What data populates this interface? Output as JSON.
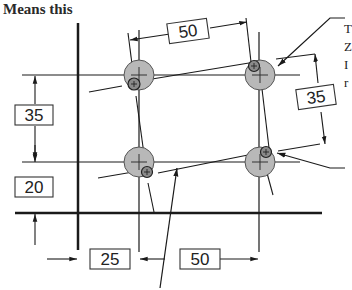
{
  "title": "Means this",
  "side_text": [
    "T",
    "Z",
    "I",
    "r"
  ],
  "dimensions": {
    "top_spacing": "50",
    "right_spacing": "35",
    "left_spacing": "35",
    "left_offset": "20",
    "bottom_offset": "25",
    "bottom_spacing": "50"
  },
  "colors": {
    "line": "#1a1a1a",
    "hole_fill": "#b8b8b8",
    "hole_stroke": "#555555",
    "tol_fill": "#9a9a9a"
  }
}
